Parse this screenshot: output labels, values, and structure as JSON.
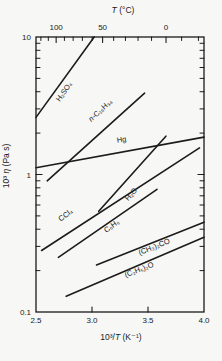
{
  "chart_data": {
    "type": "line",
    "title": "",
    "xlabel": "10³/T (K⁻¹)",
    "ylabel": "10³ η (Pa s)",
    "top_xlabel": "T (°C)",
    "x_range": [
      2.5,
      4.0
    ],
    "y_range": [
      0.1,
      10
    ],
    "y_scale": "log",
    "x_tick_values": [
      2.5,
      3.0,
      3.5,
      4.0
    ],
    "x_tick_labels": [
      "2.5",
      "3.0",
      "3.5",
      "4.0"
    ],
    "x_inner_tick_values": [
      3.0,
      3.5
    ],
    "y_tick_values": [
      0.1,
      1,
      10
    ],
    "y_tick_labels": [
      "0.1",
      "1",
      "10"
    ],
    "top_tick_celsius": [
      100,
      50,
      0
    ],
    "top_tick_labels": [
      "100",
      "50",
      "0"
    ],
    "top_minor_tick_celsius": [
      120,
      110,
      90,
      80,
      70,
      60,
      40,
      30,
      20,
      10,
      -10,
      -20
    ],
    "grid": false,
    "legend": "labels-on-lines",
    "line_color": "#1b1b1b",
    "series": [
      {
        "name": "h2so4",
        "label": "H₂SO₄",
        "points": [
          [
            2.5,
            2.6
          ],
          [
            3.02,
            10.0
          ]
        ]
      },
      {
        "name": "n-c16h34",
        "label": "n-C₁₆H₃₄",
        "points": [
          [
            2.6,
            0.9
          ],
          [
            3.47,
            3.9
          ]
        ]
      },
      {
        "name": "hg",
        "label": "Hg",
        "points": [
          [
            2.5,
            1.12
          ],
          [
            4.0,
            1.87
          ]
        ]
      },
      {
        "name": "h2o",
        "label": "H₂O",
        "points": [
          [
            3.06,
            0.54
          ],
          [
            3.66,
            1.9
          ]
        ]
      },
      {
        "name": "ccl4",
        "label": "CCl₄",
        "points": [
          [
            2.55,
            0.28
          ],
          [
            3.96,
            1.56
          ]
        ]
      },
      {
        "name": "c6h6",
        "label": "C₆H₆",
        "points": [
          [
            2.7,
            0.25
          ],
          [
            3.58,
            0.78
          ]
        ]
      },
      {
        "name": "acetone",
        "label": "(CH₃)₂CO",
        "points": [
          [
            3.04,
            0.22
          ],
          [
            4.0,
            0.45
          ]
        ]
      },
      {
        "name": "ether",
        "label": "(C₂H₅)₂O",
        "points": [
          [
            2.77,
            0.13
          ],
          [
            4.0,
            0.35
          ]
        ]
      }
    ]
  }
}
